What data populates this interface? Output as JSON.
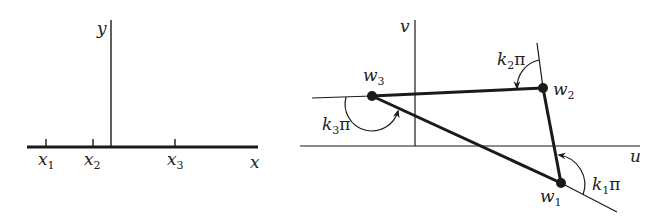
{
  "left_panel": {
    "x_axis_label": "x",
    "y_axis_label": "y",
    "ticks": [
      {
        "name": "x",
        "sub": "1",
        "px": 46
      },
      {
        "name": "x",
        "sub": "2",
        "px": 93
      },
      {
        "name": "x",
        "sub": "3",
        "px": 175
      }
    ]
  },
  "right_panel": {
    "u_axis_label": "u",
    "v_axis_label": "v",
    "vertices": [
      {
        "name": "w",
        "sub": "1",
        "x": 561,
        "y": 183
      },
      {
        "name": "w",
        "sub": "2",
        "x": 543,
        "y": 88
      },
      {
        "name": "w",
        "sub": "3",
        "x": 372,
        "y": 96
      }
    ],
    "angles": [
      {
        "k": "k",
        "sub": "1",
        "pi": "π"
      },
      {
        "k": "k",
        "sub": "2",
        "pi": "π"
      },
      {
        "k": "k",
        "sub": "3",
        "pi": "π"
      }
    ]
  },
  "colors": {
    "stroke": "#1a1a1a",
    "background": "#ffffff"
  }
}
